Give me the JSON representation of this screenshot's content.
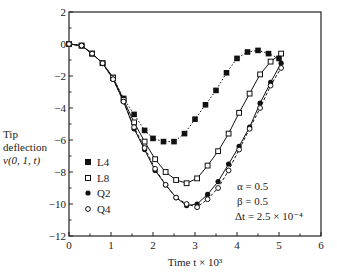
{
  "chart_data": {
    "type": "line",
    "title": "",
    "xlabel": "Time t × 10³",
    "ylabel": [
      "Tip",
      "deflection",
      "v(0, 1, t)"
    ],
    "xlim": [
      0,
      6
    ],
    "ylim": [
      -12,
      2
    ],
    "xticks": [
      0,
      1,
      2,
      3,
      4,
      5,
      6
    ],
    "yticks": [
      2,
      0,
      -2,
      -4,
      -6,
      -8,
      -10,
      -12
    ],
    "grid": false,
    "legend_position": "lower-left",
    "annotations": [
      "α = 0.5",
      "β = 0.5",
      "Δt = 2.5 × 10⁻⁴"
    ],
    "series": [
      {
        "name": "L4",
        "marker": "filled-square",
        "line": "dotted",
        "x": [
          0.0,
          0.3,
          0.55,
          0.8,
          1.05,
          1.3,
          1.55,
          1.8,
          2.0,
          2.25,
          2.5,
          2.75,
          3.0,
          3.25,
          3.5,
          3.75,
          4.0,
          4.25,
          4.5,
          4.75,
          5.0
        ],
        "y": [
          0.0,
          -0.1,
          -0.6,
          -1.2,
          -2.1,
          -3.4,
          -4.4,
          -5.4,
          -5.9,
          -6.1,
          -6.1,
          -5.6,
          -4.7,
          -3.8,
          -2.9,
          -1.8,
          -0.9,
          -0.5,
          -0.4,
          -0.6,
          -0.9
        ]
      },
      {
        "name": "L8",
        "marker": "hollow-square",
        "line": "solid",
        "x": [
          0.0,
          0.3,
          0.55,
          0.8,
          1.05,
          1.3,
          1.55,
          1.8,
          2.05,
          2.3,
          2.55,
          2.8,
          3.05,
          3.3,
          3.55,
          3.8,
          4.05,
          4.3,
          4.55,
          4.8,
          5.05
        ],
        "y": [
          0.0,
          -0.1,
          -0.6,
          -1.2,
          -2.1,
          -3.5,
          -4.9,
          -6.1,
          -7.2,
          -8.0,
          -8.5,
          -8.7,
          -8.4,
          -7.6,
          -6.7,
          -5.6,
          -4.3,
          -3.1,
          -1.9,
          -1.1,
          -0.6
        ]
      },
      {
        "name": "Q2",
        "marker": "filled-circle",
        "line": "solid",
        "x": [
          0.0,
          0.3,
          0.55,
          0.8,
          1.05,
          1.3,
          1.55,
          1.8,
          2.05,
          2.3,
          2.55,
          2.8,
          3.05,
          3.3,
          3.55,
          3.8,
          4.05,
          4.3,
          4.55,
          4.8,
          5.05
        ],
        "y": [
          0.0,
          -0.1,
          -0.6,
          -1.2,
          -2.2,
          -3.6,
          -5.3,
          -6.6,
          -7.9,
          -8.8,
          -9.6,
          -10.1,
          -10.0,
          -9.4,
          -8.6,
          -7.5,
          -6.4,
          -5.2,
          -3.7,
          -2.4,
          -1.2
        ]
      },
      {
        "name": "Q4",
        "marker": "hollow-circle",
        "line": "dashed",
        "x": [
          0.0,
          0.3,
          0.55,
          0.8,
          1.05,
          1.3,
          1.55,
          1.8,
          2.05,
          2.3,
          2.55,
          2.8,
          3.05,
          3.3,
          3.55,
          3.8,
          4.05,
          4.3,
          4.55,
          4.8,
          5.05
        ],
        "y": [
          0.0,
          -0.1,
          -0.6,
          -1.2,
          -2.2,
          -3.6,
          -5.2,
          -6.5,
          -7.8,
          -8.8,
          -9.6,
          -10.0,
          -10.2,
          -9.7,
          -9.0,
          -7.9,
          -6.6,
          -5.3,
          -4.0,
          -2.6,
          -1.5
        ]
      }
    ]
  },
  "axis_labels": {
    "x": "Time t × 10³",
    "y_line1": "Tip",
    "y_line2": "deflection",
    "y_line3": "v(0, 1, t)"
  },
  "legend": [
    {
      "label": "L4",
      "marker": "filled-square"
    },
    {
      "label": "L8",
      "marker": "hollow-square"
    },
    {
      "label": "Q2",
      "marker": "filled-circle"
    },
    {
      "label": "Q4",
      "marker": "hollow-circle"
    }
  ],
  "annotations": {
    "alpha": "α = 0.5",
    "beta": "β = 0.5",
    "dt": "Δt = 2.5 × 10⁻⁴"
  }
}
